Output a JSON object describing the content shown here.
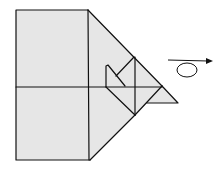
{
  "diagram": {
    "type": "origami-fold-step",
    "colors": {
      "paper": "#e6e6e6",
      "line": "#111111",
      "background": "#ffffff"
    },
    "symbols": [
      {
        "name": "turn-over-arrow",
        "meaning": "turn the model over"
      }
    ]
  }
}
